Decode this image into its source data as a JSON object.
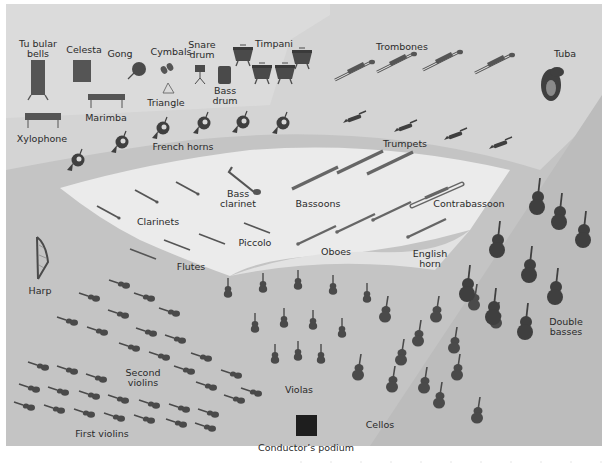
{
  "colors": {
    "page_bg": "#ffffff",
    "back_tier": "#d2d2d2",
    "mid_tier": "#dcdcdc",
    "wind_tier": "#ececec",
    "string_floor": "#c2c2c2",
    "bass_band": "#bdbdbd",
    "instrument": "#4a4a4a",
    "podium": "#1e1e1e",
    "text": "#2a2a2a"
  },
  "labels": {
    "tubular_bells": [
      "Tu bular",
      "bells"
    ],
    "celesta": "Celesta",
    "gong": "Gong",
    "cymbals": "Cymbals",
    "snare_drum": [
      "Snare",
      "drum"
    ],
    "timpani": "Timpani",
    "trombones": "Trombones",
    "tuba": "Tuba",
    "triangle": "Triangle",
    "bass_drum": [
      "Bass",
      "drum"
    ],
    "marimba": "Marimba",
    "xylophone": "Xylophone",
    "french_horns": "French horns",
    "trumpets": "Trumpets",
    "bass_clarinet": [
      "Bass",
      "clarinet"
    ],
    "bassoons": "Bassoons",
    "contrabassoon": "Contrabassoon",
    "clarinets": "Clarinets",
    "piccolo": "Piccolo",
    "flutes": "Flutes",
    "oboes": "Oboes",
    "english_horn": [
      "English",
      "horn"
    ],
    "harp": "Harp",
    "second_violins": [
      "Second",
      "violins"
    ],
    "first_violins": "First violins",
    "violas": "Violas",
    "cellos": "Cellos",
    "double_basses": [
      "Double",
      "basses"
    ],
    "conductors_podium": "Conductor’s podium"
  },
  "sections": {
    "french_horns": [
      [
        75,
        168
      ],
      [
        118,
        150
      ],
      [
        160,
        132
      ],
      [
        200,
        124
      ],
      [
        240,
        122
      ],
      [
        280,
        122
      ]
    ],
    "trombones": [
      [
        340,
        72
      ],
      [
        382,
        64
      ],
      [
        425,
        60
      ],
      [
        470,
        60
      ]
    ],
    "trumpets": [
      [
        355,
        118
      ],
      [
        405,
        126
      ],
      [
        455,
        134
      ],
      [
        500,
        142
      ]
    ],
    "timpani": [
      [
        243,
        55
      ],
      [
        262,
        75
      ],
      [
        285,
        75
      ],
      [
        302,
        60
      ]
    ],
    "clarinets": [
      [
        108,
        212
      ],
      [
        143,
        197
      ],
      [
        180,
        188
      ]
    ],
    "flutes": [
      [
        143,
        253
      ],
      [
        175,
        242
      ],
      [
        210,
        236
      ]
    ],
    "piccolo": [
      [
        255,
        228
      ]
    ],
    "bassoons": [
      [
        312,
        177
      ],
      [
        355,
        163
      ],
      [
        385,
        152
      ]
    ],
    "oboes": [
      [
        320,
        234
      ],
      [
        358,
        221
      ],
      [
        393,
        210
      ]
    ],
    "english_horn": [
      [
        426,
        227
      ]
    ],
    "first_violins": [
      [
        40,
        397
      ],
      [
        70,
        402
      ],
      [
        100,
        407
      ],
      [
        130,
        412
      ],
      [
        163,
        413
      ],
      [
        192,
        418
      ],
      [
        218,
        421
      ],
      [
        45,
        375
      ],
      [
        75,
        381
      ],
      [
        105,
        386
      ],
      [
        135,
        392
      ],
      [
        165,
        396
      ],
      [
        195,
        403
      ],
      [
        225,
        407
      ],
      [
        50,
        358
      ],
      [
        80,
        364
      ],
      [
        110,
        368
      ]
    ],
    "second_violins": [
      [
        90,
        275
      ],
      [
        115,
        294
      ],
      [
        145,
        312
      ],
      [
        175,
        330
      ],
      [
        205,
        348
      ],
      [
        235,
        368
      ],
      [
        68,
        318
      ],
      [
        98,
        330
      ],
      [
        128,
        349
      ],
      [
        160,
        371
      ],
      [
        193,
        395
      ],
      [
        230,
        404
      ],
      [
        60,
        290
      ],
      [
        95,
        304
      ],
      [
        150,
        285
      ],
      [
        178,
        302
      ],
      [
        205,
        318
      ]
    ],
    "violas": [
      [
        236,
        290
      ],
      [
        264,
        285
      ],
      [
        297,
        282
      ],
      [
        333,
        290
      ],
      [
        368,
        298
      ],
      [
        255,
        326
      ],
      [
        283,
        322
      ],
      [
        312,
        325
      ],
      [
        342,
        330
      ],
      [
        276,
        356
      ],
      [
        298,
        355
      ],
      [
        321,
        359
      ]
    ],
    "cellos": [
      [
        393,
        382
      ],
      [
        418,
        330
      ],
      [
        440,
        394
      ],
      [
        458,
        366
      ],
      [
        481,
        410
      ],
      [
        512,
        358
      ],
      [
        522,
        304
      ],
      [
        532,
        410
      ],
      [
        406,
        306
      ],
      [
        428,
        356
      ]
    ],
    "double_basses": [
      [
        465,
        271
      ],
      [
        491,
        255
      ],
      [
        505,
        305
      ],
      [
        530,
        222
      ],
      [
        555,
        235
      ],
      [
        575,
        247
      ],
      [
        535,
        328
      ],
      [
        570,
        290
      ],
      [
        587,
        315
      ]
    ]
  }
}
